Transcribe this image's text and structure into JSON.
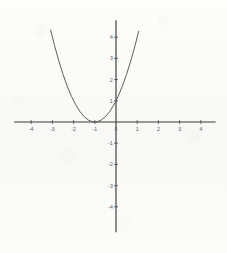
{
  "figure": {
    "title": "",
    "background_color": "#fbfbfa",
    "axis_color": "#3a3a3a",
    "curve_color": "#555555",
    "label_color": "#575757"
  },
  "chart_data": {
    "type": "line",
    "title": "",
    "subtitle": "",
    "xlabel": "",
    "ylabel": "",
    "equation": "y = (x + 1)^2",
    "grid": false,
    "legend": false,
    "legend_position": "none",
    "xlim": [
      -4.8,
      4.7
    ],
    "ylim": [
      -5.2,
      4.8
    ],
    "xticks": [
      -4,
      -3,
      -2,
      -1,
      0,
      1,
      2,
      3,
      4
    ],
    "yticks": [
      -4,
      -3,
      -2,
      -1,
      1,
      2,
      3,
      4
    ],
    "xtick_labels": [
      "-4",
      "-3",
      "-2",
      "-1",
      "0",
      "1",
      "2",
      "3",
      "4"
    ],
    "ytick_labels": [
      "-4",
      "-3",
      "-2",
      "-1",
      "1",
      "2",
      "3",
      "4"
    ],
    "vertex": [
      -1,
      0
    ],
    "y_intercept": [
      0,
      1
    ],
    "x_intercept": [
      -1,
      0
    ],
    "x_domain_drawn": [
      -3.08,
      1.07
    ],
    "series": [
      {
        "name": "y = (x + 1)^2",
        "color": "#555555",
        "x": [
          -3.08,
          -2.9,
          -2.7,
          -2.5,
          -2.3,
          -2.1,
          -1.9,
          -1.7,
          -1.5,
          -1.3,
          -1.1,
          -1.0,
          -0.9,
          -0.7,
          -0.5,
          -0.3,
          -0.1,
          0.0,
          0.1,
          0.3,
          0.5,
          0.7,
          0.9,
          1.07
        ],
        "y": [
          4.33,
          3.61,
          2.89,
          2.25,
          1.69,
          1.21,
          0.81,
          0.49,
          0.25,
          0.09,
          0.01,
          0.0,
          0.01,
          0.09,
          0.25,
          0.49,
          0.81,
          1.0,
          1.21,
          1.69,
          2.25,
          2.89,
          3.61,
          4.28
        ]
      }
    ]
  },
  "axes": {
    "x_axis_name": "horizontal-axis",
    "y_axis_name": "vertical-axis"
  }
}
